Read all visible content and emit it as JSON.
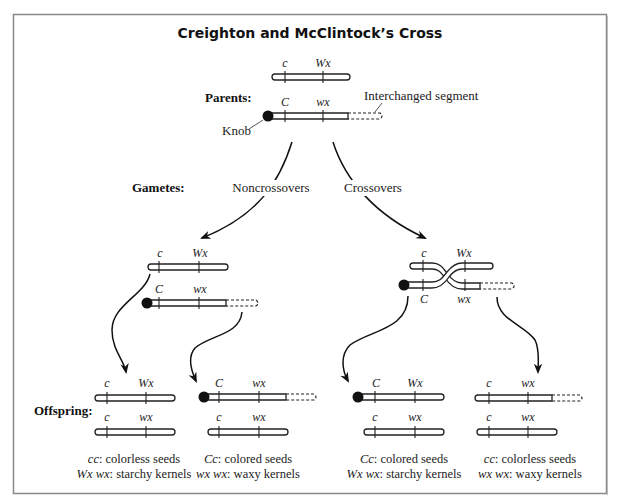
{
  "title": "Creighton and McClintock’s Cross",
  "colors": {
    "frame": "#8a8a8a",
    "ink": "#111111",
    "background": "#ffffff"
  },
  "row_labels": {
    "parents": "Parents:",
    "gametes": "Gametes:",
    "offspring": "Offspring:"
  },
  "annotations": {
    "knob": "Knob",
    "interchanged_segment": "Interchanged segment"
  },
  "branches": {
    "noncrossovers": "Noncrossovers",
    "crossovers": "Crossovers"
  },
  "parents": {
    "top": {
      "gene1": "c",
      "gene2": "Wx",
      "knob": false,
      "interchanged": false
    },
    "bottom": {
      "gene1": "C",
      "gene2": "wx",
      "knob": true,
      "interchanged": true
    }
  },
  "gametes": {
    "noncrossover": {
      "top": {
        "gene1": "c",
        "gene2": "Wx"
      },
      "bottom": {
        "gene1": "C",
        "gene2": "wx"
      }
    },
    "crossover": {
      "top_labels": {
        "gene1": "c",
        "gene2": "Wx"
      },
      "bottom_labels": {
        "gene1": "C",
        "gene2": "wx"
      }
    }
  },
  "offspring": [
    {
      "top": {
        "gene1": "c",
        "gene2": "Wx"
      },
      "bottom": {
        "gene1": "c",
        "gene2": "wx"
      },
      "caption1_genotype": "cc",
      "caption1_text": ": colorless seeds",
      "caption2_genotype": "Wx wx",
      "caption2_text": ": starchy kernels"
    },
    {
      "top": {
        "gene1": "C",
        "gene2": "wx"
      },
      "bottom": {
        "gene1": "c",
        "gene2": "wx"
      },
      "caption1_genotype": "Cc",
      "caption1_text": ": colored seeds",
      "caption2_genotype": "wx wx",
      "caption2_text": ": waxy kernels"
    },
    {
      "top": {
        "gene1": "C",
        "gene2": "Wx"
      },
      "bottom": {
        "gene1": "c",
        "gene2": "wx"
      },
      "caption1_genotype": "Cc",
      "caption1_text": ": colored seeds",
      "caption2_genotype": "Wx wx",
      "caption2_text": ": starchy kernels"
    },
    {
      "top": {
        "gene1": "c",
        "gene2": "wx"
      },
      "bottom": {
        "gene1": "c",
        "gene2": "wx"
      },
      "caption1_genotype": "cc",
      "caption1_text": ": colorless seeds",
      "caption2_genotype": "wx wx",
      "caption2_text": ": waxy kernels"
    }
  ]
}
